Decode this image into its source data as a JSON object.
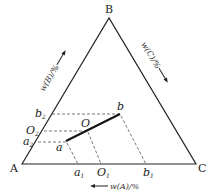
{
  "diagram": {
    "type": "ternary-phase-diagram",
    "vertices": [
      {
        "id": "A",
        "label": "A",
        "x": 22,
        "y": 164
      },
      {
        "id": "B",
        "label": "B",
        "x": 109,
        "y": 18
      },
      {
        "id": "C",
        "label": "C",
        "x": 196,
        "y": 164
      }
    ],
    "axis_labels": {
      "A": "w(A)/%",
      "B": "w(B)/%",
      "C": "w(C)/%"
    },
    "points": [
      {
        "id": "a",
        "label": "a",
        "x": 66,
        "y": 141
      },
      {
        "id": "O",
        "label": "O",
        "x": 87,
        "y": 130
      },
      {
        "id": "b",
        "label": "b",
        "x": 120,
        "y": 114
      }
    ],
    "left_edge_marks": [
      {
        "id": "b2",
        "base": "b",
        "subscript": "2",
        "y": 114
      },
      {
        "id": "O2",
        "base": "O",
        "subscript": "2",
        "y": 131
      },
      {
        "id": "a2",
        "base": "a",
        "subscript": "2",
        "y": 142
      }
    ],
    "base_marks": [
      {
        "id": "a1",
        "base": "a",
        "subscript": "1",
        "x": 78
      },
      {
        "id": "O1",
        "base": "O",
        "subscript": "1",
        "x": 101
      },
      {
        "id": "b1",
        "base": "b",
        "subscript": "1",
        "x": 146
      }
    ],
    "colors": {
      "line": "#222222",
      "dash": "#555555",
      "background": "#ffffff"
    }
  }
}
